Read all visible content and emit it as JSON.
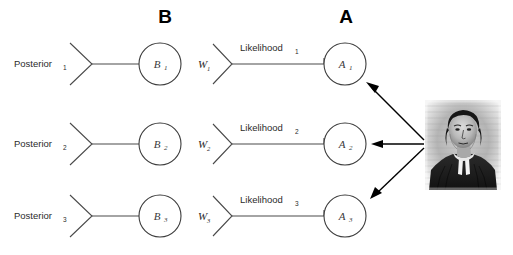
{
  "diagram": {
    "background_color": "#ffffff",
    "line_color": "#4a4a4a",
    "arrow_color": "#000000",
    "text_color": "#2b2b2b",
    "column_headers": [
      {
        "label": "B",
        "x": 165,
        "y": 22
      },
      {
        "label": "A",
        "x": 346,
        "y": 22
      }
    ],
    "rows": [
      {
        "y": 64,
        "posterior_label": "Posterior",
        "posterior_sub": "1",
        "b_label": "B",
        "b_sub": "1",
        "w_label": "W",
        "w_sub": "1",
        "likelihood_label": "Likelihood",
        "likelihood_sub": "1",
        "a_label": "A",
        "a_sub": "1"
      },
      {
        "y": 144,
        "posterior_label": "Posterior",
        "posterior_sub": "2",
        "b_label": "B",
        "b_sub": "2",
        "w_label": "W",
        "w_sub": "2",
        "likelihood_label": "Likelihood",
        "likelihood_sub": "2",
        "a_label": "A",
        "a_sub": "2"
      },
      {
        "y": 216,
        "posterior_label": "Posterior",
        "posterior_sub": "3",
        "b_label": "B",
        "b_sub": "3",
        "w_label": "W",
        "w_sub": "3",
        "likelihood_label": "Likelihood",
        "likelihood_sub": "3",
        "a_label": "A",
        "a_sub": "3"
      }
    ],
    "portrait": {
      "name": "thomas-bayes-portrait",
      "alt": "Engraved portrait of Thomas Bayes"
    }
  }
}
